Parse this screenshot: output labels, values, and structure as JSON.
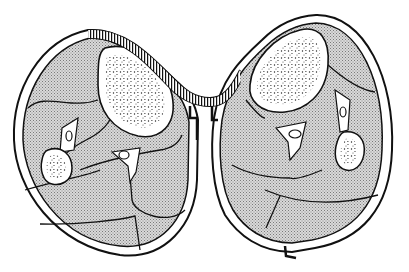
{
  "figure": {
    "title": "Cross-section diagram of two limbs joined by a skin bridge",
    "colors": {
      "background": "#ffffff",
      "ink": "#111111",
      "stipple_fill": "#cfcfcf",
      "bone_fill": "#ffffff",
      "skin_ring": "#ffffff"
    },
    "parts": [
      {
        "name": "left-limb-section"
      },
      {
        "name": "right-limb-section"
      },
      {
        "name": "skin-bridge"
      },
      {
        "name": "left-bone-marrow"
      },
      {
        "name": "right-bone-marrow"
      },
      {
        "name": "left-small-bone"
      },
      {
        "name": "right-small-bone"
      },
      {
        "name": "vessels"
      }
    ]
  }
}
